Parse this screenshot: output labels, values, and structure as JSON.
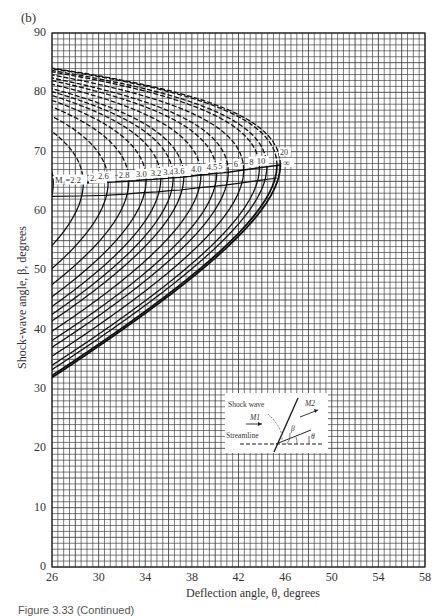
{
  "panel_label": "(b)",
  "caption": "Figure 3.33 (Continued)",
  "chart_data": {
    "type": "line",
    "xlabel": "Deflection angle, θ, degrees",
    "ylabel": "Shock-wave angle, β, degrees",
    "xlim": [
      26,
      58
    ],
    "ylim": [
      0,
      90
    ],
    "xticks": [
      26,
      30,
      34,
      38,
      42,
      46,
      50,
      54,
      58
    ],
    "yticks": [
      0,
      10,
      20,
      30,
      40,
      50,
      60,
      70,
      80,
      90
    ],
    "grid": {
      "on": true,
      "x_minor_step": 0.5,
      "y_minor_step": 1
    },
    "gamma": 1.4,
    "series": [
      {
        "name": "M1=2.2",
        "mach": 2.2,
        "label": "M1=2.2"
      },
      {
        "name": "M1=2.4",
        "mach": 2.4,
        "label": "2.4"
      },
      {
        "name": "M1=2.6",
        "mach": 2.6,
        "label": "2.6"
      },
      {
        "name": "M1=2.8",
        "mach": 2.8,
        "label": "2.8"
      },
      {
        "name": "M1=3.0",
        "mach": 3.0,
        "label": "3.0"
      },
      {
        "name": "M1=3.2",
        "mach": 3.2,
        "label": "3.2"
      },
      {
        "name": "M1=3.4",
        "mach": 3.4,
        "label": "3.4"
      },
      {
        "name": "M1=3.6",
        "mach": 3.6,
        "label": "3.6"
      },
      {
        "name": "M1=4.0",
        "mach": 4.0,
        "label": "4.0"
      },
      {
        "name": "M1=4.5",
        "mach": 4.5,
        "label": "4.5"
      },
      {
        "name": "M1=5",
        "mach": 5,
        "label": "5"
      },
      {
        "name": "M1=6",
        "mach": 6,
        "label": "6"
      },
      {
        "name": "M1=8",
        "mach": 8,
        "label": "8"
      },
      {
        "name": "M1=10",
        "mach": 10,
        "label": "10"
      },
      {
        "name": "M1=20",
        "mach": 20,
        "label": "20"
      },
      {
        "name": "M1=∞",
        "mach": 1000,
        "label": "∞"
      }
    ],
    "annotations": {
      "max_deflection_line": "line through maximum-deflection points of each curve",
      "sonic_line": "line separating M2>1 and M2<1",
      "strong_branch_style": "dashed",
      "weak_branch_style": "solid",
      "infinite_mach_max": {
        "theta": 45.6,
        "beta": 67.8
      }
    },
    "inset": {
      "labels": [
        "Shock wave",
        "M1",
        "Streamline",
        "M2",
        "β",
        "θ"
      ]
    }
  }
}
